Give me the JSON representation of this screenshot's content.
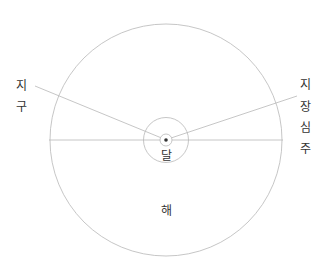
{
  "diagram": {
    "title": "",
    "labels": {
      "earth": [
        "지",
        "구"
      ],
      "geocentric": [
        "지",
        "장",
        "심",
        "주"
      ],
      "moon": "달",
      "sun": "해"
    },
    "colors": {
      "line": "#b8b8b8",
      "text": "#333333",
      "dot": "#333333",
      "background": "#ffffff"
    }
  }
}
